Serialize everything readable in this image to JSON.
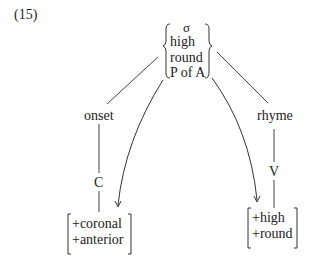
{
  "example_number": "(15)",
  "root": {
    "label": "σ",
    "features": [
      "high",
      "round",
      "P of A"
    ]
  },
  "left_branch": {
    "node": "onset",
    "child": "C",
    "features": [
      "+coronal",
      "+anterior"
    ]
  },
  "right_branch": {
    "node": "rhyme",
    "child": "V",
    "features": [
      "+high",
      "+round"
    ]
  }
}
